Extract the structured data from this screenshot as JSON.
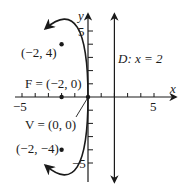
{
  "diagram": {
    "type": "parabola-graph",
    "axes": {
      "x_label": "x",
      "y_label": "y",
      "x_ticks": {
        "neg": "−5",
        "pos": "5"
      },
      "y_ticks": {
        "pos": "5",
        "neg": "−5"
      }
    },
    "directrix_label": "D: x = 2",
    "focus_label": "F = (−2, 0)",
    "vertex_label": "V = (0, 0)",
    "point_upper_label": "(−2, 4)",
    "point_lower_label": "(−2, −4)",
    "colors": {
      "ink": "#1a1a1a",
      "background": "#ffffff"
    },
    "equation_implied": "y^2 = -8x",
    "points": [
      {
        "name": "focus",
        "x": -2,
        "y": 0
      },
      {
        "name": "vertex",
        "x": 0,
        "y": 0
      },
      {
        "name": "upper",
        "x": -2,
        "y": 4
      },
      {
        "name": "lower",
        "x": -2,
        "y": -4
      }
    ]
  }
}
